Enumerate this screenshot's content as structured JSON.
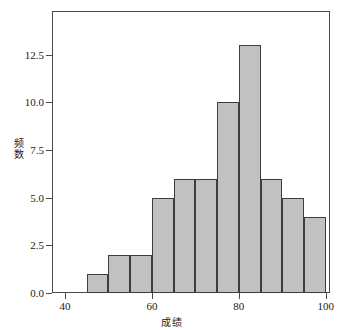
{
  "chart_data": {
    "type": "bar",
    "title": "",
    "subtitle": "",
    "xlabel": "成绩",
    "ylabel": "频数",
    "ylabel_chars": [
      "频",
      "数"
    ],
    "categories": [
      "45-50",
      "50-55",
      "55-60",
      "60-65",
      "65-70",
      "70-75",
      "75-80",
      "80-85",
      "85-90",
      "90-95",
      "95-100"
    ],
    "bin_starts": [
      45,
      50,
      55,
      60,
      65,
      70,
      75,
      80,
      85,
      90,
      95
    ],
    "bin_ends": [
      50,
      55,
      60,
      65,
      70,
      75,
      80,
      85,
      90,
      95,
      100
    ],
    "bin_width": 5,
    "values": [
      1,
      2,
      2,
      5,
      6,
      6,
      10,
      13,
      6,
      5,
      4
    ],
    "xlim": [
      37,
      101
    ],
    "ylim": [
      0,
      14.8
    ],
    "xticks": [
      40,
      60,
      80,
      100
    ],
    "xtick_labels": [
      "40",
      "60",
      "80",
      "100"
    ],
    "yticks": [
      0.0,
      2.5,
      5.0,
      7.5,
      10.0,
      12.5
    ],
    "ytick_labels": [
      "0.0",
      "2.5",
      "5.0",
      "7.5",
      "10.0",
      "12.5"
    ],
    "grid": false,
    "legend": null,
    "bar_fill_color": "#c1c1c1",
    "bar_edge_color": "#3d3d3d",
    "axis_color": "#4a4a4a",
    "background_color": "#ffffff",
    "text_color": "#1a1a1a"
  }
}
